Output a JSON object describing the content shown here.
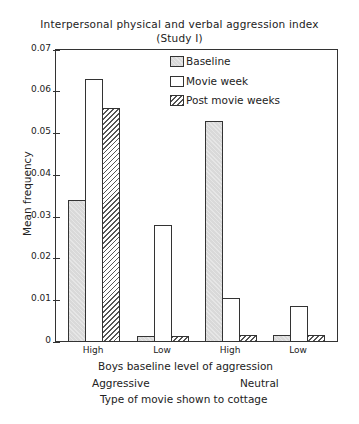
{
  "chart_data": {
    "type": "bar",
    "title": "Interpersonal physical and verbal aggression index",
    "subtitle": "(Study I)",
    "xlabel": "Boys baseline level of aggression",
    "xlabel_group_labels": [
      "Aggressive",
      "Neutral"
    ],
    "xlabel_footer": "Type of movie shown to cottage",
    "ylabel": "Mean frequency",
    "ylim": [
      0,
      0.07
    ],
    "yticks": [
      "0",
      "0.01",
      "0.02",
      "0.03",
      "0.04",
      "0.05",
      "0.06",
      "0.07"
    ],
    "categories": [
      "High",
      "Low",
      "High",
      "Low"
    ],
    "category_groups": [
      "Aggressive",
      "Aggressive",
      "Neutral",
      "Neutral"
    ],
    "series": [
      {
        "name": "Baseline",
        "values": [
          0.034,
          0.0013,
          0.053,
          0.0015
        ]
      },
      {
        "name": "Movie week",
        "values": [
          0.063,
          0.028,
          0.0105,
          0.0085
        ]
      },
      {
        "name": "Post movie weeks",
        "values": [
          0.056,
          0.0013,
          0.0015,
          0.0015
        ]
      }
    ],
    "legend_position": "upper center inside",
    "grid": false
  },
  "text": {
    "title": "Interpersonal physical and verbal aggression index",
    "subtitle": "(Study I)",
    "ylabel": "Mean frequency",
    "xlabel": "Boys baseline level of aggression",
    "group_aggressive": "Aggressive",
    "group_neutral": "Neutral",
    "footer": "Type of movie shown to cottage",
    "legend": [
      "Baseline",
      "Movie week",
      "Post movie weeks"
    ],
    "categories": [
      "High",
      "Low",
      "High",
      "Low"
    ],
    "yticks": [
      "0",
      "0.01",
      "0.02",
      "0.03",
      "0.04",
      "0.05",
      "0.06",
      "0.07"
    ]
  }
}
